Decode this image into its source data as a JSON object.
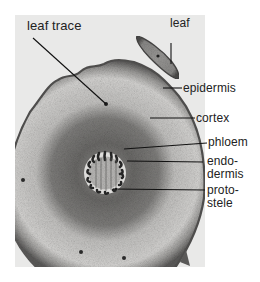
{
  "figure": {
    "colors": {
      "page_background": "#ffffff",
      "photo_background": "#e9e9e8",
      "cortex_light": "#d9d8d6",
      "cortex_dark": "#6e6d6b",
      "epidermis": "#5a5958",
      "stele_ring": "#dedddb",
      "xylem_dark": "#2a2a2a",
      "leader_line": "#111111"
    },
    "labels": {
      "leaf_trace": "leaf trace",
      "leaf": "leaf",
      "epidermis": "epidermis",
      "cortex": "cortex",
      "phloem": "phloem",
      "endodermis_line1": "endo-",
      "endodermis_line2": "dermis",
      "protostele_line1": "proto-",
      "protostele_line2": "stele"
    }
  }
}
